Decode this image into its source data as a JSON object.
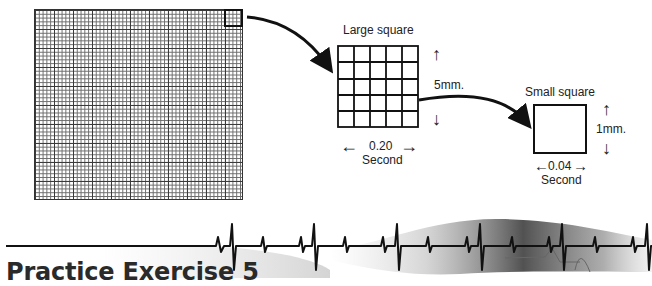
{
  "diagram": {
    "ecg_paper": {
      "description": "ECG graph paper grid",
      "fine_grid_px": 3.8,
      "large_grid_px": 19
    },
    "large_square": {
      "label": "Large square",
      "rows": 5,
      "cols": 5,
      "height_label": "5mm.",
      "width_value": "0.20",
      "width_unit": "Second",
      "up_arrow": "↑",
      "down_arrow": "↓",
      "left_arrow": "←",
      "right_arrow": "→"
    },
    "small_square": {
      "label": "Small square",
      "height_label": "1mm.",
      "width_value": "0.04",
      "width_unit": "Second",
      "up_arrow": "↑",
      "down_arrow": "↓",
      "left_arrow": "←",
      "right_arrow": "→"
    }
  },
  "footer": {
    "title": "Practice Exercise 5"
  },
  "colors": {
    "line": "#111111",
    "text": "#222222",
    "background": "#ffffff"
  }
}
